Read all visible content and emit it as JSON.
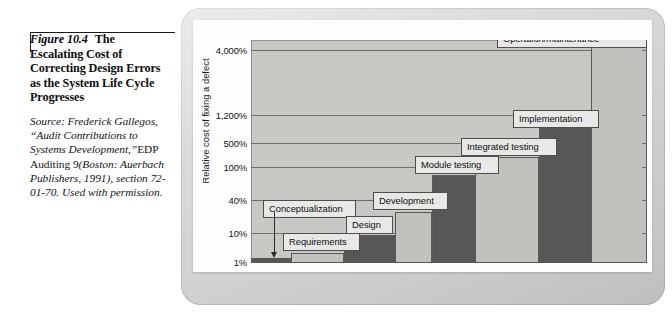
{
  "caption": {
    "figure_number": "Figure 10.4",
    "title": "The Escalating Cost of Correcting Design Errors as the System Life Cycle Progresses",
    "source_line_1": "Source: Frederick",
    "source_line_2": "Gallegos, “Audit",
    "source_line_3": "Contributions to Systems",
    "source_line_4_italic": "Development,”",
    "source_line_4_roman": "EDP",
    "source_line_5_roman": "Auditing 9",
    "source_line_5_italic": "(Boston:",
    "source_line_6": "Auerbach Publishers,",
    "source_line_7": "1991), section 72-01-70.",
    "source_line_8": "Used with permission."
  },
  "chart_data": {
    "type": "bar",
    "title": "",
    "xlabel": "",
    "ylabel": "Relative cost of fixing a defect",
    "y_scale": "log-like ordinal",
    "ytick_labels": [
      "4,000%",
      "1,200%",
      "500%",
      "100%",
      "40%",
      "10%",
      "1%"
    ],
    "ytick_values": [
      4000,
      1200,
      500,
      100,
      40,
      10,
      1
    ],
    "grid": true,
    "legend": "none",
    "categories": [
      "Conceptualization",
      "Requirements",
      "Design",
      "Development",
      "Module testing",
      "Integrated testing",
      "Implementation",
      "Operation/maintenance"
    ],
    "values": [
      1,
      10,
      40,
      100,
      500,
      1200,
      4000,
      4000
    ],
    "value_labels": [
      "1%",
      "10%",
      "40%",
      "100%",
      "500%",
      "1,200%",
      "4,000%",
      "4,000%"
    ],
    "bar_fills": [
      "dark",
      "light",
      "dark",
      "light",
      "dark",
      "light",
      "dark",
      "light"
    ],
    "colors": {
      "bar_light": "#c2c1be",
      "bar_dark": "#585756",
      "plot_background": "#c9c8c5",
      "gridline": "#6e6d6b",
      "label_box": "#e9e8e6",
      "plate": "#d6d5d3",
      "panel": "#fdfdfd"
    },
    "annotation": {
      "pointer_from": "Conceptualization",
      "pointer_to": "first bar",
      "shape": "down-arrow"
    }
  },
  "chart_layout": {
    "bars": [
      {
        "name": "Conceptualization",
        "left_pct": 0.0,
        "width_pct": 10.1,
        "top_px": 218,
        "fill": "dark"
      },
      {
        "name": "Requirements",
        "left_pct": 10.1,
        "width_pct": 13.4,
        "top_px": 213,
        "fill": "light"
      },
      {
        "name": "Design",
        "left_pct": 23.5,
        "width_pct": 12.9,
        "top_px": 195,
        "fill": "dark"
      },
      {
        "name": "Development",
        "left_pct": 36.4,
        "width_pct": 9.3,
        "top_px": 172,
        "fill": "light"
      },
      {
        "name": "Module testing",
        "left_pct": 45.7,
        "width_pct": 10.9,
        "top_px": 135,
        "fill": "dark"
      },
      {
        "name": "Integrated testing",
        "left_pct": 56.6,
        "width_pct": 16.2,
        "top_px": 117,
        "fill": "light"
      },
      {
        "name": "Implementation",
        "left_pct": 72.8,
        "width_pct": 13.0,
        "top_px": 88,
        "fill": "dark"
      },
      {
        "name": "Operation/maintenance",
        "left_pct": 85.8,
        "width_pct": 14.2,
        "top_px": 0,
        "fill": "light"
      }
    ],
    "gridlines_top_px": [
      10,
      75,
      103,
      127,
      160,
      193,
      222
    ],
    "labels": [
      {
        "name": "Conceptualization",
        "text": "Conceptualization",
        "left_px": 12,
        "top_px": 160,
        "width_px": 93
      },
      {
        "name": "Requirements",
        "text": "Requirements",
        "left_px": 32,
        "top_px": 193,
        "width_px": 77
      },
      {
        "name": "Design",
        "text": "Design",
        "left_px": 95,
        "top_px": 176,
        "width_px": 47
      },
      {
        "name": "Development",
        "text": "Development",
        "left_px": 122,
        "top_px": 152,
        "width_px": 75
      },
      {
        "name": "Module testing",
        "text": "Module testing",
        "left_px": 164,
        "top_px": 116,
        "width_px": 84
      },
      {
        "name": "Integrated testing",
        "text": "Integrated testing",
        "left_px": 210,
        "top_px": 98,
        "width_px": 96
      },
      {
        "name": "Implementation",
        "text": "Implementation",
        "left_px": 262,
        "top_px": 70,
        "width_px": 86
      },
      {
        "name": "Operation/maintenance",
        "text": "Operation/maintenance",
        "left_px": 246,
        "top_px": -10,
        "width_px": 150
      }
    ]
  }
}
